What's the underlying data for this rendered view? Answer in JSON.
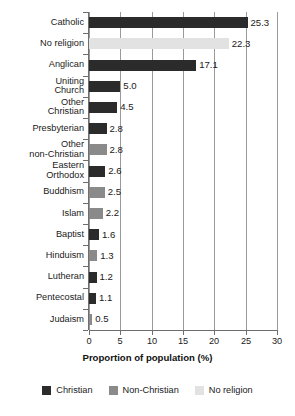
{
  "chart_data": {
    "type": "bar",
    "orientation": "horizontal",
    "title": "",
    "xlabel": "Proportion of population (%)",
    "ylabel": "",
    "xlim": [
      0,
      30
    ],
    "xticks": [
      0,
      5,
      10,
      15,
      20,
      25,
      30
    ],
    "grid": true,
    "legend_position": "bottom",
    "categories": [
      "Catholic",
      "No religion",
      "Anglican",
      "Uniting\nChurch",
      "Other\nChristian",
      "Presbyterian",
      "Other\nnon-Christian",
      "Eastern\nOrthodox",
      "Buddhism",
      "Islam",
      "Baptist",
      "Hinduism",
      "Lutheran",
      "Pentecostal",
      "Judaism"
    ],
    "values": [
      25.3,
      22.3,
      17.1,
      5.0,
      4.5,
      2.8,
      2.8,
      2.6,
      2.5,
      2.2,
      1.6,
      1.3,
      1.2,
      1.1,
      0.5
    ],
    "value_labels": [
      "25.3",
      "22.3",
      "17.1",
      "5.0",
      "4.5",
      "2.8",
      "2.8",
      "2.6",
      "2.5",
      "2.2",
      "1.6",
      "1.3",
      "1.2",
      "1.1",
      "0.5"
    ],
    "groups": [
      "Christian",
      "No religion",
      "Christian",
      "Christian",
      "Christian",
      "Christian",
      "Non-Christian",
      "Christian",
      "Non-Christian",
      "Non-Christian",
      "Christian",
      "Non-Christian",
      "Christian",
      "Christian",
      "Non-Christian"
    ],
    "legend": [
      {
        "label": "Christian",
        "color": "#2b2b2b"
      },
      {
        "label": "Non-Christian",
        "color": "#8a8a8a"
      },
      {
        "label": "No religion",
        "color": "#e2e2e2"
      }
    ],
    "colors": {
      "Christian": "#2b2b2b",
      "Non-Christian": "#8a8a8a",
      "No religion": "#e2e2e2"
    }
  }
}
